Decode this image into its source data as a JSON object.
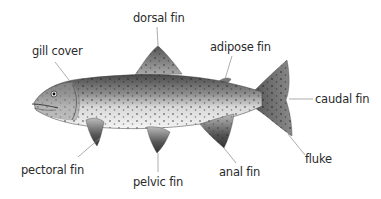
{
  "diagram": {
    "labels": {
      "dorsal_fin": "dorsal fin",
      "gill_cover": "gill cover",
      "adipose_fin": "adipose fin",
      "caudal_fin": "caudal fin",
      "pectoral_fin": "pectoral fin",
      "pelvic_fin": "pelvic fin",
      "anal_fin": "anal fin",
      "fluke": "fluke"
    },
    "colors": {
      "background": "#ffffff",
      "text": "#2a2a2a",
      "leader_line": "#8a8a8a"
    }
  }
}
